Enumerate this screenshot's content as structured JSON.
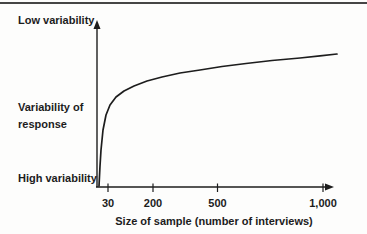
{
  "figure": {
    "background": "#fdfdfc",
    "top_rule_color": "#454545"
  },
  "chart_data": {
    "type": "line",
    "title": "",
    "xlabel": "Size of sample (number of interviews)",
    "ylabel_lines": [
      "Variability of",
      "response"
    ],
    "y_top_annotation": "Low variability",
    "y_bottom_annotation": "High variability",
    "x_tick_labels": [
      "30",
      "200",
      "500",
      "1,000"
    ],
    "x_tick_values": [
      30,
      200,
      500,
      1000
    ],
    "legend": "none",
    "grid": false,
    "axes_px": {
      "origin": [
        97,
        187
      ],
      "x_end": 334,
      "y_end": 20,
      "tick_xs": [
        108,
        153,
        217.5,
        323
      ],
      "tick_y1": 183.5,
      "tick_y2": 192
    },
    "series": [
      {
        "name": "variability-vs-sample-size",
        "points_px": [
          [
            99,
            186
          ],
          [
            100,
            166
          ],
          [
            101,
            150
          ],
          [
            103,
            130
          ],
          [
            106,
            115
          ],
          [
            110,
            105
          ],
          [
            116,
            97
          ],
          [
            124,
            91
          ],
          [
            134,
            86
          ],
          [
            147,
            81
          ],
          [
            162,
            77
          ],
          [
            180,
            73
          ],
          [
            200,
            70
          ],
          [
            222,
            66.5
          ],
          [
            246,
            63.5
          ],
          [
            272,
            60.5
          ],
          [
            300,
            58
          ],
          [
            320,
            55.8
          ],
          [
            337,
            54
          ]
        ]
      }
    ],
    "colors": {
      "stroke": "#1d1d1d",
      "text": "#1c1c1c"
    }
  }
}
